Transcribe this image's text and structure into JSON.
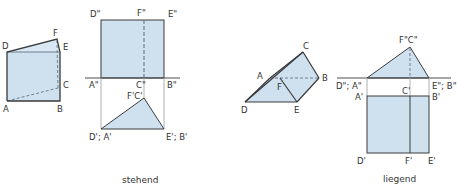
{
  "colors": {
    "fill": "#cfe1ef",
    "edge": "#3a3a3a",
    "projection": "#b0b0b0",
    "hidden": "#6f7f8f"
  },
  "left_figure": {
    "caption": "stehend",
    "prism_labels": {
      "A": "A",
      "B": "B",
      "C": "C",
      "D": "D",
      "E": "E",
      "F": "F"
    },
    "front_view_labels": {
      "D": "D\"",
      "F": "F\"",
      "E": "E\"",
      "A": "A\"",
      "C": "C\"",
      "B": "B\""
    },
    "top_view_labels": {
      "FC": "F'C'",
      "DA": "D'; A'",
      "EB": "E'; B'"
    }
  },
  "right_figure": {
    "caption": "liegend",
    "prism_labels": {
      "A": "A",
      "B": "B",
      "C": "C",
      "D": "D",
      "E": "E",
      "F": "F"
    },
    "front_view_labels": {
      "FC": "F\"C\"",
      "DA": "D\"; A\"",
      "EB": "E\"; B\""
    },
    "top_view_labels": {
      "C": "C'",
      "A": "A'",
      "B": "B'",
      "D": "D'",
      "F": "F'",
      "E": "E'"
    }
  }
}
